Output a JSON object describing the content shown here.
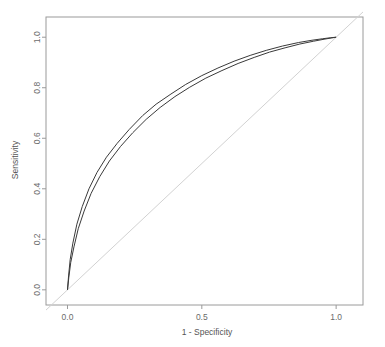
{
  "chart_data": {
    "type": "line",
    "title": "",
    "subtitle": "",
    "xlabel": "1 - Specificity",
    "ylabel": "Sensitivity",
    "xlim": [
      -0.08,
      1.1
    ],
    "ylim": [
      -0.06,
      1.08
    ],
    "grid": false,
    "legend": "none",
    "xticks": [
      0.0,
      0.5,
      1.0
    ],
    "xticklabels": [
      "0.0",
      "0.5",
      "1.0"
    ],
    "yticks": [
      0.0,
      0.2,
      0.4,
      0.6,
      0.8,
      1.0
    ],
    "yticklabels": [
      "0.0",
      "0.2",
      "0.4",
      "0.6",
      "0.8",
      "1.0"
    ],
    "series": [
      {
        "name": "roc-curve-1",
        "color": "#3a3a3a",
        "x": [
          0.0,
          0.004,
          0.01,
          0.02,
          0.035,
          0.055,
          0.08,
          0.11,
          0.145,
          0.185,
          0.23,
          0.28,
          0.33,
          0.385,
          0.44,
          0.5,
          0.56,
          0.62,
          0.68,
          0.74,
          0.8,
          0.86,
          0.91,
          0.95,
          0.98,
          1.0
        ],
        "y": [
          0.0,
          0.055,
          0.12,
          0.185,
          0.26,
          0.33,
          0.4,
          0.465,
          0.525,
          0.58,
          0.635,
          0.69,
          0.735,
          0.775,
          0.813,
          0.848,
          0.878,
          0.905,
          0.928,
          0.948,
          0.965,
          0.979,
          0.988,
          0.994,
          0.998,
          1.0
        ]
      },
      {
        "name": "roc-curve-2",
        "color": "#3a3a3a",
        "x": [
          0.0,
          0.005,
          0.012,
          0.024,
          0.04,
          0.062,
          0.088,
          0.12,
          0.156,
          0.197,
          0.243,
          0.293,
          0.345,
          0.4,
          0.455,
          0.515,
          0.575,
          0.635,
          0.695,
          0.752,
          0.81,
          0.865,
          0.915,
          0.955,
          0.982,
          1.0
        ],
        "y": [
          0.0,
          0.05,
          0.108,
          0.17,
          0.242,
          0.312,
          0.382,
          0.448,
          0.51,
          0.567,
          0.622,
          0.675,
          0.722,
          0.765,
          0.802,
          0.838,
          0.868,
          0.896,
          0.92,
          0.941,
          0.958,
          0.973,
          0.984,
          0.992,
          0.997,
          1.0
        ]
      }
    ],
    "reference_line": {
      "name": "chance-diagonal",
      "color": "#d2d2d2",
      "x": [
        -0.08,
        1.1
      ],
      "y": [
        -0.08,
        1.1
      ]
    }
  },
  "axes": {
    "x_title": "1 - Specificity",
    "y_title": "Sensitivity",
    "x_tick_labels": [
      "0.0",
      "0.5",
      "1.0"
    ],
    "y_tick_labels": [
      "0.0",
      "0.2",
      "0.4",
      "0.6",
      "0.8",
      "1.0"
    ]
  },
  "colors": {
    "background": "#ffffff",
    "curve": "#3a3a3a",
    "reference": "#d2d2d2",
    "axis": "#9a9a9a",
    "text": "#6b6b6b"
  }
}
